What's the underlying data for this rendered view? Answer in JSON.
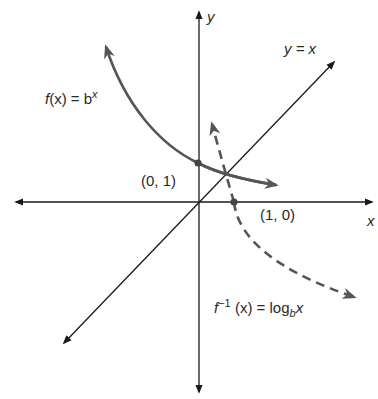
{
  "diagram": {
    "axes": {
      "x_label": "x",
      "y_label": "y"
    },
    "curves": {
      "exponential": {
        "label_f": "f",
        "label_rest": "(x) = b",
        "label_sup": "x",
        "style": "solid",
        "color": "#555555"
      },
      "identity": {
        "label": "y = x",
        "style": "solid",
        "color": "#1a1a1a"
      },
      "logarithm": {
        "label_f": "f",
        "label_inv": "−1",
        "label_mid": " (x) = log",
        "label_sub": "b",
        "label_end": "x",
        "style": "dashed",
        "color": "#555555"
      }
    },
    "points": [
      {
        "label": "(0, 1)"
      },
      {
        "label": "(1, 0)"
      }
    ]
  }
}
